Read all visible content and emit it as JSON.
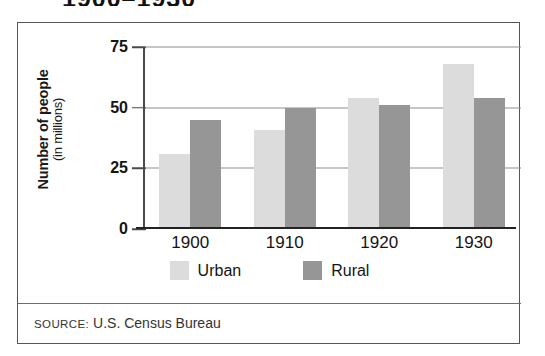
{
  "title_clipped": "1900–1930",
  "source": {
    "prefix": "SOURCE:",
    "text": "U.S. Census Bureau"
  },
  "axis": {
    "y_title_main": "Number of people",
    "y_title_sub": "(in millions)"
  },
  "legend": {
    "items": [
      {
        "label": "Urban",
        "color": "#dcdcdc"
      },
      {
        "label": "Rural",
        "color": "#969696"
      }
    ]
  },
  "chart_data": {
    "type": "bar",
    "title": "1900–1930",
    "xlabel": "",
    "ylabel": "Number of people (in millions)",
    "ylim": [
      0,
      75
    ],
    "yticks": [
      0,
      25,
      50,
      75
    ],
    "ytick_labels": [
      "0",
      "25",
      "50",
      "75"
    ],
    "grid": true,
    "legend_position": "bottom",
    "categories": [
      "1900",
      "1910",
      "1920",
      "1930"
    ],
    "series": [
      {
        "name": "Urban",
        "color": "#dcdcdc",
        "values": [
          31,
          41,
          54,
          68
        ]
      },
      {
        "name": "Rural",
        "color": "#969696",
        "values": [
          45,
          50,
          51,
          54
        ]
      }
    ],
    "source": "SOURCE: U.S. Census Bureau"
  }
}
